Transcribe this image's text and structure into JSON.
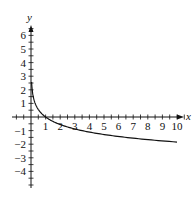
{
  "chart_data": {
    "type": "line",
    "title": "",
    "xlabel": "x",
    "ylabel": "y",
    "xlim": [
      -0.5,
      11
    ],
    "ylim": [
      -5,
      7
    ],
    "x_ticks": [
      1,
      2,
      3,
      4,
      5,
      6,
      7,
      8,
      9,
      10
    ],
    "y_ticks": [
      -4,
      -3,
      -2,
      -1,
      1,
      2,
      3,
      4,
      5,
      6
    ],
    "x_tick_labels": [
      "1",
      "2",
      "3",
      "4",
      "5",
      "6",
      "7",
      "8",
      "9",
      "10"
    ],
    "y_tick_labels": [
      "−4",
      "−3",
      "−2",
      "−1",
      "1",
      "2",
      "3",
      "4",
      "5",
      "6"
    ],
    "grid": false,
    "legend": null,
    "series": [
      {
        "name": "curve",
        "color": "#111111",
        "x": [
          0.04,
          0.1,
          0.2,
          0.3,
          0.5,
          0.75,
          1,
          1.5,
          2,
          3,
          4,
          5,
          6,
          7,
          8,
          9,
          10
        ],
        "y": [
          2.58,
          1.84,
          1.29,
          0.96,
          0.55,
          0.23,
          0.0,
          -0.32,
          -0.55,
          -0.88,
          -1.11,
          -1.29,
          -1.43,
          -1.56,
          -1.66,
          -1.76,
          -1.84
        ]
      }
    ]
  }
}
